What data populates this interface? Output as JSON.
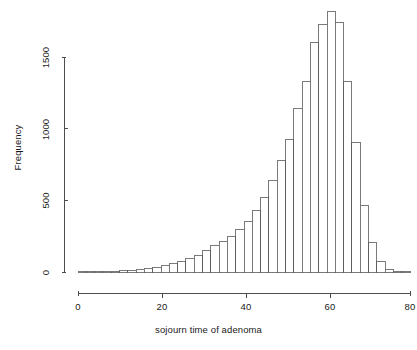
{
  "chart_data": {
    "type": "bar",
    "subtype": "histogram",
    "title": "",
    "xlabel": "sojourn time of adenoma",
    "ylabel": "Frequency",
    "xlim": [
      0,
      80
    ],
    "ylim": [
      0,
      1830
    ],
    "grid": false,
    "legend": null,
    "bin_width": 2,
    "x_ticks": [
      0,
      20,
      40,
      60,
      80
    ],
    "x_tick_labels": [
      "0",
      "20",
      "40",
      "60",
      "80"
    ],
    "y_ticks": [
      0,
      500,
      1000,
      1500
    ],
    "y_tick_labels": [
      "0",
      "500",
      "1000",
      "1500"
    ],
    "bin_starts": [
      0,
      2,
      4,
      6,
      8,
      10,
      12,
      14,
      16,
      18,
      20,
      22,
      24,
      26,
      28,
      30,
      32,
      34,
      36,
      38,
      40,
      42,
      44,
      46,
      48,
      50,
      52,
      54,
      56,
      58,
      60,
      62,
      64,
      66,
      68,
      70,
      72,
      74,
      76,
      78
    ],
    "bin_ends": [
      2,
      4,
      6,
      8,
      10,
      12,
      14,
      16,
      18,
      20,
      22,
      24,
      26,
      28,
      30,
      32,
      34,
      36,
      38,
      40,
      42,
      44,
      46,
      48,
      50,
      52,
      54,
      56,
      58,
      60,
      62,
      64,
      66,
      68,
      70,
      72,
      74,
      76,
      78,
      80
    ],
    "categories": [
      "0-2",
      "2-4",
      "4-6",
      "6-8",
      "8-10",
      "10-12",
      "12-14",
      "14-16",
      "16-18",
      "18-20",
      "20-22",
      "22-24",
      "24-26",
      "26-28",
      "28-30",
      "30-32",
      "32-34",
      "34-36",
      "36-38",
      "38-40",
      "40-42",
      "42-44",
      "44-46",
      "46-48",
      "48-50",
      "50-52",
      "52-54",
      "54-56",
      "56-58",
      "58-60",
      "60-62",
      "62-64",
      "64-66",
      "66-68",
      "68-70",
      "70-72",
      "72-74",
      "74-76",
      "76-78",
      "78-80"
    ],
    "values": [
      2,
      3,
      4,
      5,
      7,
      9,
      12,
      16,
      22,
      30,
      42,
      58,
      76,
      96,
      118,
      148,
      186,
      215,
      250,
      300,
      350,
      430,
      520,
      640,
      775,
      925,
      1140,
      1330,
      1600,
      1730,
      1820,
      1740,
      1330,
      905,
      465,
      205,
      70,
      20,
      6,
      2
    ]
  },
  "axes": {
    "y_title": "Frequency",
    "x_title": "sojourn time of adenoma"
  }
}
